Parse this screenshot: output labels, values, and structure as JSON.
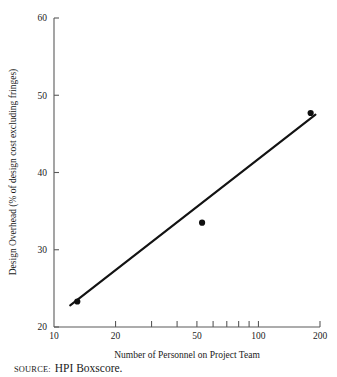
{
  "figure": {
    "source_label": "SOURCE:",
    "source_text": "HPI Boxscore."
  },
  "chart_data": {
    "type": "scatter",
    "title": "",
    "xlabel": "Number of Personnel on Project Team",
    "ylabel": "Design Overhead (% of design cost excluding fringes)",
    "xscale": "log",
    "yscale": "linear",
    "xlim": [
      10,
      200
    ],
    "ylim": [
      20,
      60
    ],
    "grid": false,
    "legend": null,
    "x_tick_labels": [
      "10",
      "20",
      "50",
      "100",
      "200"
    ],
    "x_tick_values": [
      10,
      20,
      50,
      100,
      200
    ],
    "x_minor_tick_values": [
      30,
      40,
      60,
      70,
      80,
      90
    ],
    "y_tick_labels": [
      "20",
      "30",
      "40",
      "50",
      "60"
    ],
    "y_tick_values": [
      20,
      30,
      40,
      50,
      60
    ],
    "points": [
      {
        "x": 13,
        "y": 23.3
      },
      {
        "x": 53,
        "y": 33.5
      },
      {
        "x": 180,
        "y": 47.7
      }
    ],
    "fit_line": {
      "label": "",
      "x_start": 12,
      "y_start": 22.8,
      "x_end": 190,
      "y_end": 47.5
    }
  }
}
